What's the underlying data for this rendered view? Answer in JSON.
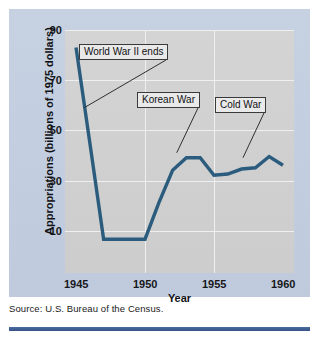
{
  "figure": {
    "source_note": "Source: U.S. Bureau of the Census.",
    "accent_color": "#2b5c7e",
    "panel_color": "#c3cfe0",
    "plot_color": "#d2d2d2",
    "rule_color": "#3f5f95"
  },
  "chart_data": {
    "type": "line",
    "title": "",
    "xlabel": "Year",
    "ylabel": "Appropriations (billions of 1975 dollars)",
    "xlim": [
      1944.2,
      1960.8
    ],
    "ylim": [
      0,
      97
    ],
    "xticks": [
      1945,
      1950,
      1955,
      1960
    ],
    "xtick_labels": [
      "1945",
      "1950",
      "1955",
      "1960"
    ],
    "yticks": [
      10,
      30,
      50,
      70,
      90
    ],
    "ytick_labels": [
      "10",
      "30",
      "50",
      "70",
      "90"
    ],
    "grid": true,
    "grid_axes": "both",
    "legend": "none",
    "series": [
      {
        "name": "Appropriations",
        "color": "#2b5c7e",
        "x": [
          1945,
          1946,
          1947,
          1948,
          1949,
          1950,
          1951,
          1952,
          1953,
          1954,
          1955,
          1956,
          1957,
          1958,
          1959,
          1960
        ],
        "values": [
          90,
          52,
          13.5,
          13.5,
          13.5,
          13.5,
          28,
          41,
          46,
          46,
          39,
          39.5,
          41.5,
          42,
          46.5,
          43
        ]
      }
    ],
    "annotations": [
      {
        "label": "World War II ends",
        "x": 1946.1,
        "y": 78,
        "target_x": 1945.6,
        "target_y": 66
      },
      {
        "label": "Korean War",
        "x": 1950.6,
        "y": 59,
        "target_x": 1952.3,
        "target_y": 48
      },
      {
        "label": "Cold War",
        "x": 1955.7,
        "y": 57,
        "target_x": 1957.1,
        "target_y": 46
      }
    ]
  }
}
